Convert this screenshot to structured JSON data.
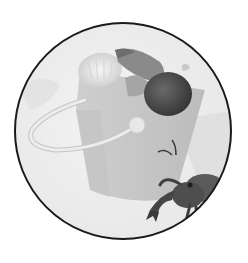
{
  "image": {
    "description": "Grayscale circular illustration of a sand pail filled with seashells and a hermit crab climbing at the lower right",
    "subjects": [
      "sand pail",
      "seashells",
      "hermit crab"
    ],
    "palette": {
      "background": "#ffffff",
      "circle_fill": "#ededed",
      "circle_border": "#1a1a1a",
      "pail": "#c8c8c8",
      "pail_shadow": "#bdbdbd",
      "handle": "#e2e2e2",
      "shell_light": "#e6e6e6",
      "shell_mid": "#9a9a9a",
      "shell_dark": "#4d4d4d",
      "crab": "#505050",
      "crab_dark": "#2e2e2e"
    }
  }
}
